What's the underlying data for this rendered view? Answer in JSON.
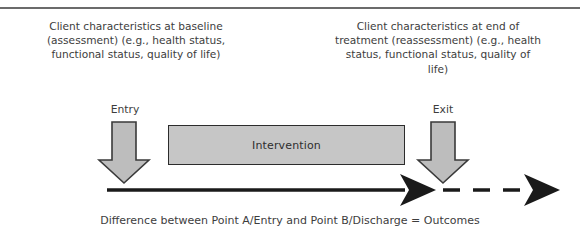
{
  "figure": {
    "title_rule_present": true,
    "background_color": "#ffffff",
    "text_color": "#3d3d3d"
  },
  "descriptions": {
    "left": "Client characteristics at baseline (assessment) (e.g., health status, functional status, quality of life)",
    "right": "Client characteristics at end of treatment (reassessment) (e.g., health status, functional status, quality of life)"
  },
  "gates": {
    "entry_label": "Entry",
    "exit_label": "Exit"
  },
  "intervention": {
    "label": "Intervention",
    "fill_color": "#c6c6c6",
    "border_color": "#2c2c2c"
  },
  "arrows": {
    "down_arrow_fill": "#bdbdbd",
    "down_arrow_stroke": "#3a3a3a",
    "timeline_color": "#1a1a1a",
    "entry_arrow_name": "entry-down-arrow",
    "exit_arrow_name": "exit-down-arrow",
    "solid_segment": "solid",
    "dashed_segment": "dashed"
  },
  "caption": {
    "text": "Difference between Point A/Entry and Point B/Discharge = Outcomes"
  }
}
